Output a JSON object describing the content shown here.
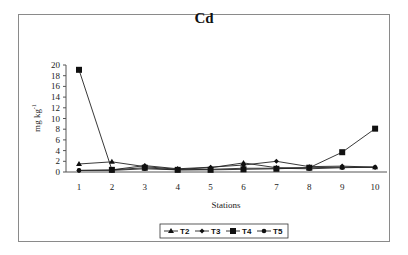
{
  "chart_data": {
    "type": "line",
    "title": "Cd",
    "xlabel": "Stations",
    "ylabel": "mg kg-1",
    "x": [
      1,
      2,
      3,
      4,
      5,
      6,
      7,
      8,
      9,
      10
    ],
    "ylim": [
      0,
      20
    ],
    "yticks": [
      0,
      2,
      4,
      6,
      8,
      10,
      12,
      14,
      16,
      18,
      20
    ],
    "grid": false,
    "legend_position": "bottom",
    "series": [
      {
        "name": "T2",
        "marker": "triangle",
        "values": [
          1.5,
          1.9,
          1.0,
          0.5,
          0.8,
          1.7,
          0.8,
          0.8,
          0.9,
          0.9
        ]
      },
      {
        "name": "T3",
        "marker": "diamond",
        "values": [
          0.3,
          0.4,
          1.2,
          0.6,
          0.9,
          1.3,
          2.0,
          1.0,
          1.1,
          0.9
        ]
      },
      {
        "name": "T4",
        "marker": "square",
        "values": [
          19.1,
          0.4,
          0.8,
          0.4,
          0.4,
          0.5,
          0.6,
          0.8,
          3.7,
          8.1
        ]
      },
      {
        "name": "T5",
        "marker": "circle",
        "values": [
          0.3,
          0.3,
          0.6,
          0.4,
          0.5,
          0.7,
          0.7,
          0.6,
          0.8,
          0.9
        ]
      }
    ]
  }
}
